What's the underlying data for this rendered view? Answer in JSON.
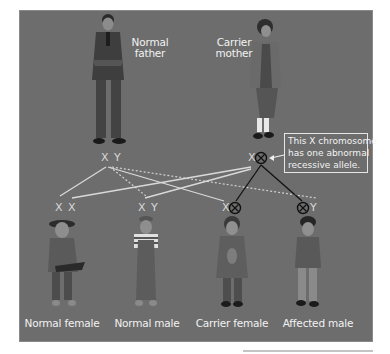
{
  "diagram": {
    "colors": {
      "background": "#6d6d6d",
      "text": "#f2f2f2",
      "normal_line": "#d9d9d9",
      "affected_line": "#111111"
    },
    "parents": {
      "father": {
        "label_line1": "Normal",
        "label_line2": "father",
        "chromosomes": "X Y"
      },
      "mother": {
        "label_line1": "Carrier",
        "label_line2": "mother",
        "chromosome_normal": "X",
        "chromosome_affected_icon": "crossed-circle-icon"
      }
    },
    "callout": {
      "line1": "This X chromosome",
      "line2": "has one abnormal",
      "line3": "recessive allele."
    },
    "children": [
      {
        "label": "Normal female",
        "chromosomes": "X X"
      },
      {
        "label": "Normal male",
        "chromosomes": "X Y"
      },
      {
        "label": "Carrier female",
        "chromosome_normal": "X",
        "chromosome_affected_icon": "crossed-circle-icon"
      },
      {
        "label": "Affected male",
        "chromosome_affected_icon": "crossed-circle-icon",
        "chromosome_normal": "Y"
      }
    ]
  }
}
